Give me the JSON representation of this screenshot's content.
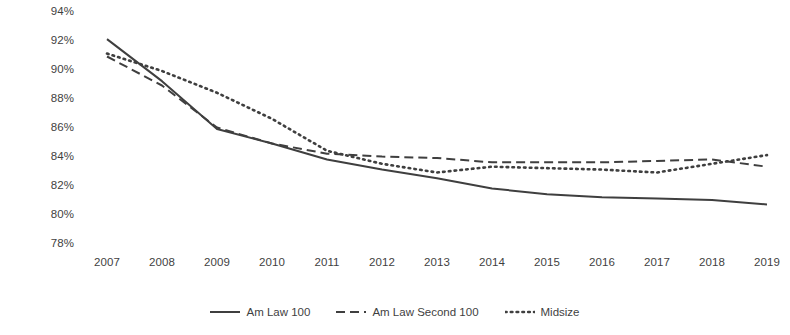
{
  "chart_data": {
    "type": "line",
    "title": "",
    "xlabel": "",
    "ylabel": "Average",
    "categories": [
      "2007",
      "2008",
      "2009",
      "2010",
      "2011",
      "2012",
      "2013",
      "2014",
      "2015",
      "2016",
      "2017",
      "2018",
      "2019"
    ],
    "ylim": [
      78,
      94
    ],
    "ytick_labels": [
      "94%",
      "92%",
      "90%",
      "88%",
      "86%",
      "84%",
      "82%",
      "80%",
      "78%"
    ],
    "ytick_values": [
      94,
      92,
      90,
      88,
      86,
      84,
      82,
      80,
      78
    ],
    "yaxis_unit": "%",
    "grid": false,
    "legend_position": "bottom",
    "series": [
      {
        "name": "Am Law 100",
        "style": "solid",
        "color": "#3f3f3f",
        "values": [
          92.2,
          89.3,
          86.0,
          85.0,
          83.9,
          83.2,
          82.6,
          81.9,
          81.5,
          81.3,
          81.2,
          81.1,
          80.8
        ]
      },
      {
        "name": "Am Law Second 100",
        "style": "dashed",
        "color": "#3f3f3f",
        "values": [
          91.0,
          89.0,
          86.1,
          85.0,
          84.3,
          84.1,
          84.0,
          83.7,
          83.7,
          83.7,
          83.8,
          83.9,
          83.4
        ]
      },
      {
        "name": "Midsize",
        "style": "dotted",
        "color": "#3f3f3f",
        "values": [
          91.2,
          90.0,
          88.5,
          86.7,
          84.5,
          83.6,
          83.0,
          83.4,
          83.3,
          83.2,
          83.0,
          83.6,
          84.2
        ]
      }
    ]
  },
  "legend": {
    "entries": [
      {
        "label": "Am Law 100",
        "swatch": "solid-line-swatch"
      },
      {
        "label": "Am Law Second 100",
        "swatch": "dashed-line-swatch"
      },
      {
        "label": "Midsize",
        "swatch": "dotted-line-swatch"
      }
    ]
  }
}
